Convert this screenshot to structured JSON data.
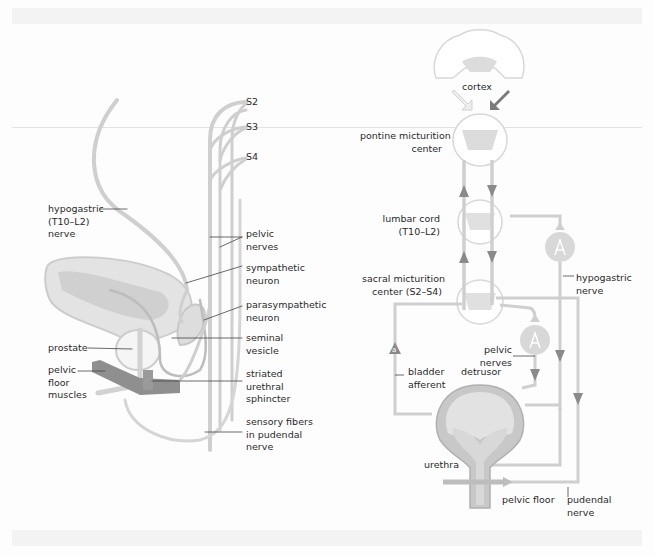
{
  "colors": {
    "nerve": "#cfcfcf",
    "organ_fill": "#e3e3e3",
    "organ_dark": "#bdbdbd",
    "muscle": "#8f8f8f",
    "arrow_light": "#eeeeee",
    "arrow_dark": "#7a7a7a",
    "text": "#2a2a2a",
    "leader": "#444444"
  },
  "left_panel": {
    "spinal_levels": [
      "S2",
      "S3",
      "S4"
    ],
    "labels": {
      "hypogastric": [
        "hypogastric",
        "(T10–L2)",
        "nerve"
      ],
      "pelvic_nerves": [
        "pelvic",
        "nerves"
      ],
      "sympathetic": [
        "sympathetic",
        "neuron"
      ],
      "parasympathetic": [
        "parasympathetic",
        "neuron"
      ],
      "seminal": [
        "seminal",
        "vesicle"
      ],
      "prostate": [
        "prostate"
      ],
      "pelvic_floor": [
        "pelvic",
        "floor",
        "muscles"
      ],
      "sphincter": [
        "striated",
        "urethral",
        "sphincter"
      ],
      "sensory": [
        "sensory fibers",
        "in pudendal",
        "nerve"
      ]
    }
  },
  "right_panel": {
    "labels": {
      "cortex": "cortex",
      "pontine": [
        "pontine micturition",
        "center"
      ],
      "lumbar": [
        "lumbar cord",
        "(T10–L2)"
      ],
      "sacral": [
        "sacral micturition",
        "center (S2–S4)"
      ],
      "hypogastric": [
        "hypogastric",
        "nerve"
      ],
      "pelvic_nerves": [
        "pelvic",
        "nerves"
      ],
      "bladder_afferent": [
        "bladder",
        "afferent"
      ],
      "detrusor": "detrusor",
      "urethra": "urethra",
      "pelvic_floor": "pelvic floor",
      "pudendal": [
        "pudendal",
        "nerve"
      ],
      "afferent_marker": "a"
    }
  }
}
